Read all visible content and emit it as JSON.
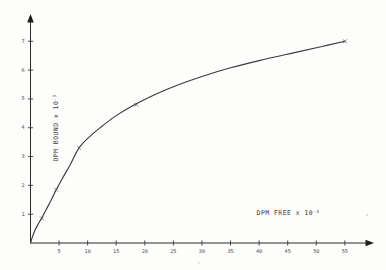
{
  "figure": {
    "name": "binding-saturation-plot",
    "background_color": "#fdfdfc",
    "ink_color": "#3b3b40"
  },
  "chart_data": {
    "type": "line",
    "title": "",
    "xlabel_text": "DPM  FREE x 10",
    "xlabel_exponent": "-3",
    "ylabel_text": "DPM BOUND x 10",
    "ylabel_exponent": "-3",
    "xlim": [
      0,
      58
    ],
    "ylim": [
      0,
      7.6
    ],
    "xticks": [
      5,
      10,
      15,
      20,
      25,
      30,
      35,
      40,
      45,
      50,
      55
    ],
    "xtick_labels": [
      "5",
      "10",
      "15",
      "20",
      "25",
      "30",
      "35",
      "40",
      "45",
      "50",
      "55"
    ],
    "yticks": [
      1,
      2,
      3,
      4,
      5,
      6,
      7
    ],
    "ytick_labels": [
      "1",
      "2",
      "3",
      "4",
      "5",
      "6",
      "7"
    ],
    "grid": false,
    "legend": "none",
    "marker": "x",
    "series": [
      {
        "name": "bound-vs-free",
        "x": [
          2.0,
          4.5,
          8.5,
          18.5,
          55.0
        ],
        "y": [
          0.85,
          1.85,
          3.3,
          4.8,
          7.0
        ]
      }
    ],
    "curve_points": {
      "x": [
        0.0,
        0.35,
        0.8,
        1.3,
        2.0,
        2.8,
        3.6,
        4.5,
        5.6,
        6.9,
        8.5,
        10.5,
        12.5,
        15.0,
        18.5,
        22.0,
        26.0,
        30.0,
        35.0,
        40.0,
        46.0,
        51.0,
        55.0
      ],
      "y": [
        0.0,
        0.22,
        0.45,
        0.64,
        0.88,
        1.18,
        1.48,
        1.85,
        2.25,
        2.7,
        3.3,
        3.72,
        4.05,
        4.42,
        4.83,
        5.17,
        5.5,
        5.78,
        6.08,
        6.33,
        6.6,
        6.82,
        7.0
      ]
    }
  }
}
